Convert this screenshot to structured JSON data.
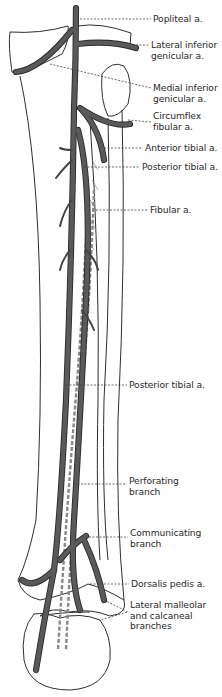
{
  "figure": {
    "colors": {
      "artery": "#555555",
      "artery_outline": "#2a2a2a",
      "bone_outline": "#2f2f2f",
      "leader_line": "#444444",
      "background": "#ffffff"
    }
  },
  "labels": [
    {
      "id": "popliteal",
      "lines": [
        "Popliteal a."
      ],
      "x": 153,
      "y": 14
    },
    {
      "id": "lateral-inferior-genicular",
      "lines": [
        "Lateral inferior",
        "genicular a."
      ],
      "x": 151,
      "y": 40
    },
    {
      "id": "medial-inferior-genicular",
      "lines": [
        "Medial inferior",
        "genicular a."
      ],
      "x": 153,
      "y": 83
    },
    {
      "id": "circumflex-fibular",
      "lines": [
        "Circumflex",
        "fibular a."
      ],
      "x": 153,
      "y": 111
    },
    {
      "id": "anterior-tibial",
      "lines": [
        "Anterior tibial a."
      ],
      "x": 145,
      "y": 144
    },
    {
      "id": "posterior-tibial-upper",
      "lines": [
        "Posterior tibial a."
      ],
      "x": 142,
      "y": 163
    },
    {
      "id": "fibular",
      "lines": [
        "Fibular a."
      ],
      "x": 150,
      "y": 206
    },
    {
      "id": "posterior-tibial-lower",
      "lines": [
        "Posterior tibial a."
      ],
      "x": 129,
      "y": 381
    },
    {
      "id": "perforating-branch",
      "lines": [
        "Perforating",
        "branch"
      ],
      "x": 129,
      "y": 476
    },
    {
      "id": "communicating-branch",
      "lines": [
        "Communicating",
        "branch"
      ],
      "x": 130,
      "y": 528
    },
    {
      "id": "dorsalis-pedis",
      "lines": [
        "Dorsalis pedis a."
      ],
      "x": 131,
      "y": 577
    },
    {
      "id": "lateral-malleolar-calcaneal",
      "lines": [
        "Lateral malleolar",
        "and calcaneal",
        "branches"
      ],
      "x": 130,
      "y": 597
    }
  ]
}
